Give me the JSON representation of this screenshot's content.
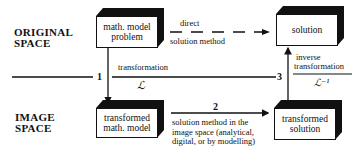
{
  "regions": {
    "original_space": "ORIGINAL\nSPACE",
    "original_line1": "ORIGINAL",
    "original_line2": "SPACE",
    "image_line1": "IMAGE",
    "image_line2": "SPACE"
  },
  "boxes": {
    "problem": {
      "line1": "math. model",
      "line2": "problem"
    },
    "solution": {
      "line1": "solution"
    },
    "transformed_model": {
      "line1": "transformed",
      "line2": "math. model"
    },
    "transformed_solution": {
      "line1": "transformed",
      "line2": "solution"
    }
  },
  "arrows": {
    "direct": {
      "line1": "direct",
      "line2": "solution method"
    },
    "step1": {
      "number": "1",
      "label": "transformation",
      "symbol": "ℒ"
    },
    "step2": {
      "number": "2",
      "line1": "solution method in the",
      "line2": "image space (analytical,",
      "line3": "digital, or by modelling)"
    },
    "step3": {
      "number": "3",
      "line1": "inverse",
      "line2": "transformation",
      "symbol": "ℒ⁻¹"
    }
  },
  "colors": {
    "ink": "#111111",
    "background": "#ffffff"
  }
}
